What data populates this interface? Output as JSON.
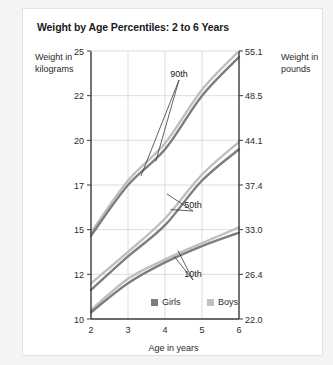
{
  "card": {
    "title": "Weight by Age Percentiles: 2 to 6 Years",
    "ylabel_left": "Weight in kilograms",
    "ylabel_right": "Weight in pounds",
    "xlabel": "Age in years"
  },
  "chart_data": {
    "type": "line",
    "title": "Weight by Age Percentiles: 2 to 6 Years",
    "xlabel": "Age in years",
    "ylabel": "Weight in kilograms",
    "ylabel_secondary": "Weight in pounds",
    "x": [
      2,
      3,
      4,
      5,
      6
    ],
    "xlim": [
      2,
      6
    ],
    "xticks": [
      "2",
      "3",
      "4",
      "5",
      "6"
    ],
    "yticks_kg": [
      "25",
      "22",
      "20",
      "17",
      "15",
      "12",
      "10"
    ],
    "yticks_lb": [
      "55.1",
      "48.5",
      "44.1",
      "37.4",
      "33.0",
      "26.4",
      "22.0"
    ],
    "grid": true,
    "legend_position": "bottom-center-inside",
    "annotations": [
      "90th",
      "50th",
      "10th"
    ],
    "colors": {
      "girls": "#7d7d7d",
      "boys": "#bfbfbf",
      "grid": "#dcdcdc",
      "axis": "#3a3a3a"
    },
    "series": [
      {
        "name": "Girls",
        "percentile": "90th",
        "color": "#7d7d7d",
        "values": [
          14.6,
          17.0,
          19.4,
          22.0,
          24.6
        ]
      },
      {
        "name": "Boys",
        "percentile": "90th",
        "color": "#bfbfbf",
        "values": [
          14.8,
          17.3,
          19.8,
          22.4,
          25.0
        ]
      },
      {
        "name": "Girls",
        "percentile": "50th",
        "color": "#7d7d7d",
        "values": [
          11.3,
          13.2,
          15.2,
          17.3,
          19.4
        ]
      },
      {
        "name": "Boys",
        "percentile": "50th",
        "color": "#bfbfbf",
        "values": [
          11.6,
          13.5,
          15.5,
          17.7,
          19.9
        ]
      },
      {
        "name": "Girls",
        "percentile": "10th",
        "color": "#7d7d7d",
        "values": [
          10.3,
          11.6,
          12.8,
          13.9,
          14.8
        ]
      },
      {
        "name": "Boys",
        "percentile": "10th",
        "color": "#bfbfbf",
        "values": [
          10.4,
          11.8,
          13.0,
          14.1,
          15.1
        ]
      }
    ],
    "legend": [
      {
        "label": "Girls",
        "color": "#7d7d7d"
      },
      {
        "label": "Boys",
        "color": "#bfbfbf"
      }
    ]
  }
}
